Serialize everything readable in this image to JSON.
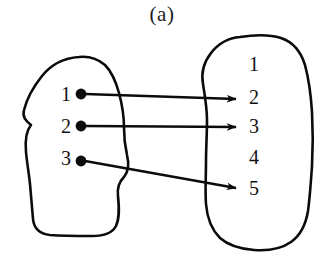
{
  "figure": {
    "caption": "(a)",
    "type": "mapping-diagram"
  },
  "domain_set": {
    "name": "left-set",
    "elements": [
      {
        "label": "1",
        "x": 66,
        "y": 96,
        "dot_x": 81,
        "dot_y": 94
      },
      {
        "label": "2",
        "x": 66,
        "y": 128,
        "dot_x": 81,
        "dot_y": 126
      },
      {
        "label": "3",
        "x": 66,
        "y": 160,
        "dot_x": 81,
        "dot_y": 161
      }
    ]
  },
  "codomain_set": {
    "name": "right-set",
    "elements": [
      {
        "label": "1",
        "x": 254,
        "y": 66
      },
      {
        "label": "2",
        "x": 254,
        "y": 99
      },
      {
        "label": "3",
        "x": 254,
        "y": 128
      },
      {
        "label": "4",
        "x": 254,
        "y": 159
      },
      {
        "label": "5",
        "x": 254,
        "y": 190
      }
    ]
  },
  "mappings": [
    {
      "from": "1",
      "to": "2",
      "x1": 85,
      "y1": 94,
      "x2": 236,
      "y2": 99
    },
    {
      "from": "2",
      "to": "3",
      "x1": 85,
      "y1": 126,
      "x2": 236,
      "y2": 127
    },
    {
      "from": "3",
      "to": "5",
      "x1": 85,
      "y1": 161,
      "x2": 236,
      "y2": 188
    }
  ],
  "colors": {
    "ink": "#0b0b0b",
    "background": "#ffffff"
  },
  "shapes": {
    "left_blob_path": "M 79 57 C 63 58 50 66 42 76 C 34 86 27 98 24 110 C 22 117 26 121 31 125 C 26 131 25 141 26 152 C 27 163 29 174 30 184 C 31 196 32 208 33 219 C 34 229 40 234 50 235 C 63 236 78 236 92 236 C 103 236 112 234 116 226 C 120 217 119 206 118 196 C 117 188 119 182 124 177 C 129 171 129 163 127 155 C 125 146 124 137 124 128 C 124 116 122 104 119 93 C 116 82 112 72 105 65 C 98 59 89 56 79 57 Z",
    "right_blob_path": "M 240 37 C 228 38 218 44 211 53 C 204 62 201 73 203 84 C 205 96 207 108 207 120 C 207 134 206 148 206 162 C 206 176 205 190 206 204 C 207 217 211 229 220 238 C 229 246 241 249 254 250 C 268 251 281 249 291 242 C 301 235 306 223 308 211 C 310 196 311 181 312 166 C 313 148 313 130 312 112 C 311 96 309 80 305 65 C 301 52 293 42 281 38 C 268 34 253 35 240 37 Z"
  }
}
